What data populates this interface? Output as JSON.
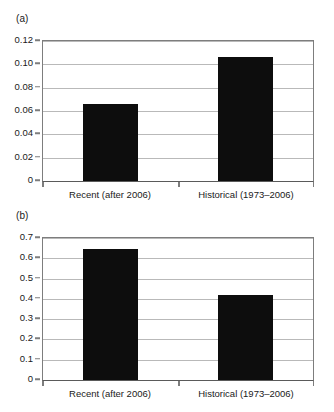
{
  "figure": {
    "background": "#ffffff",
    "bar_color": "#0d0d0d",
    "frame_color": "#7d7d7d",
    "grid_color": "#b9b9b9"
  },
  "panels": [
    {
      "label": "(a)",
      "categories": [
        "Recent (after 2006)",
        "Historical (1973–2006)"
      ],
      "ytick_labels": [
        "0.12",
        "0.10",
        "0.08",
        "0.06",
        "0.04",
        "0.02",
        "0"
      ]
    },
    {
      "label": "(b)",
      "categories": [
        "Recent (after 2006)",
        "Historical (1973–2006)"
      ],
      "ytick_labels": [
        "0.7",
        "0.6",
        "0.5",
        "0.4",
        "0.3",
        "0.2",
        "0.1",
        "0"
      ]
    }
  ],
  "chart_data": [
    {
      "type": "bar",
      "panel": "(a)",
      "title": "",
      "xlabel": "",
      "ylabel": "",
      "categories": [
        "Recent (after 2006)",
        "Historical (1973–2006)"
      ],
      "values": [
        0.066,
        0.106
      ],
      "ylim": [
        0,
        0.12
      ],
      "ytick_values": [
        0,
        0.02,
        0.04,
        0.06,
        0.08,
        0.1,
        0.12
      ],
      "ytick_labels": [
        "0",
        "0.02",
        "0.04",
        "0.06",
        "0.08",
        "0.10",
        "0.12"
      ],
      "grid": true,
      "grid_axis": "y",
      "legend": "none",
      "bar_color": "#0d0d0d"
    },
    {
      "type": "bar",
      "panel": "(b)",
      "title": "",
      "xlabel": "",
      "ylabel": "",
      "categories": [
        "Recent (after 2006)",
        "Historical (1973–2006)"
      ],
      "values": [
        0.645,
        0.417
      ],
      "ylim": [
        0,
        0.7
      ],
      "ytick_values": [
        0,
        0.1,
        0.2,
        0.3,
        0.4,
        0.5,
        0.6,
        0.7
      ],
      "ytick_labels": [
        "0",
        "0.1",
        "0.2",
        "0.3",
        "0.4",
        "0.5",
        "0.6",
        "0.7"
      ],
      "grid": true,
      "grid_axis": "y",
      "legend": "none",
      "bar_color": "#0d0d0d"
    }
  ]
}
